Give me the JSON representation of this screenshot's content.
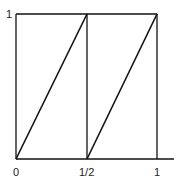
{
  "diagram": {
    "y_axis_labels": {
      "top": "1"
    },
    "x_axis_labels": {
      "left": "0",
      "middle": "1/2",
      "right": "1"
    },
    "segments": [
      {
        "from": [
          0,
          0
        ],
        "to": [
          0.5,
          1
        ]
      },
      {
        "from": [
          0.5,
          0
        ],
        "to": [
          1,
          1
        ]
      }
    ],
    "colors": {
      "line": "#111111",
      "background": "#ffffff"
    }
  }
}
